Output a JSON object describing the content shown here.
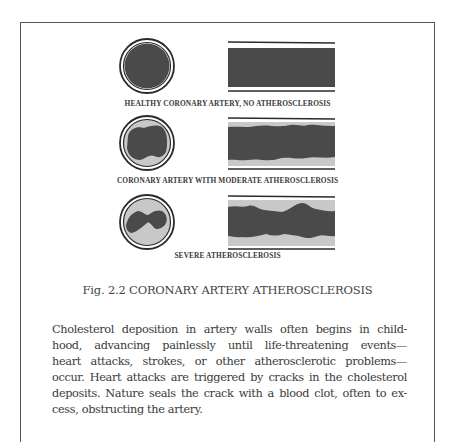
{
  "figure": {
    "panels": [
      {
        "label": "HEALTHY CORONARY ARTERY, NO ATHEROSCLEROSIS",
        "state": "healthy"
      },
      {
        "label": "CORONARY ARTERY WITH MODERATE ATHEROSCLEROSIS",
        "state": "moderate"
      },
      {
        "label": "SEVERE ATHEROSCLEROSIS",
        "state": "severe"
      }
    ],
    "caption": "Fig. 2.2  CORONARY ARTERY ATHEROSCLEROSIS",
    "colors": {
      "blood": "#4a4a4a",
      "plaque": "#c8c8c8",
      "wall": "#2a2a2a"
    }
  },
  "body": {
    "lines": [
      "Cholesterol deposition in artery walls often begins in child-",
      "hood, advancing painlessly until life-threatening events—",
      "heart attacks, strokes, or other atherosclerotic problems—",
      "occur. Heart attacks are triggered by cracks in the cholesterol",
      "deposits. Nature seals the crack with a blood clot, often to ex-",
      "cess, obstructing the artery."
    ]
  }
}
